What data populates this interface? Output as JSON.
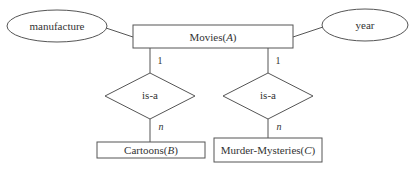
{
  "diagram": {
    "type": "er-diagram",
    "entities": [
      {
        "id": "movies",
        "name": "Movies",
        "tag": "A"
      },
      {
        "id": "cartoons",
        "name": "Cartoons",
        "tag": "B"
      },
      {
        "id": "murder",
        "name": "Murder-Mysteries",
        "tag": "C"
      }
    ],
    "attributes": [
      {
        "id": "manufacture",
        "label": "manufacture",
        "entity": "movies"
      },
      {
        "id": "year",
        "label": "year",
        "entity": "movies"
      }
    ],
    "relationships": [
      {
        "id": "isa-left",
        "label": "is-a",
        "from": "movies",
        "to": "cartoons",
        "card_from": "1",
        "card_to": "n"
      },
      {
        "id": "isa-right",
        "label": "is-a",
        "from": "movies",
        "to": "murder",
        "card_from": "1",
        "card_to": "n"
      }
    ],
    "colors": {
      "stroke": "#555555",
      "text": "#333333",
      "background": "#ffffff"
    }
  }
}
